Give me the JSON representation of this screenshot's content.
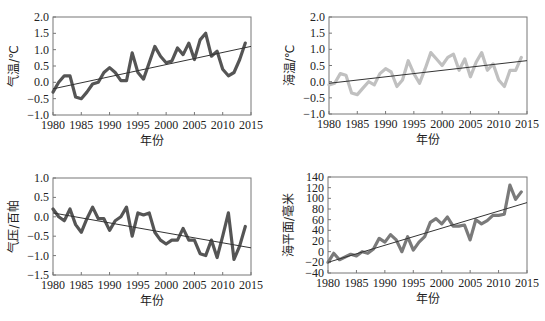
{
  "chart_data": [
    {
      "type": "line",
      "panel": "top-left",
      "title": "",
      "xlabel": "年份",
      "ylabel": "气温/℃",
      "xlim": [
        1980,
        2015
      ],
      "ylim": [
        -1.0,
        2.0
      ],
      "xticks": [
        1980,
        1985,
        1990,
        1995,
        2000,
        2005,
        2010,
        2015
      ],
      "yticks": [
        2.0,
        1.5,
        1.0,
        0.5,
        0.0,
        -0.5,
        -1.0
      ],
      "ytick_labels": [
        "2.0",
        "1.5",
        "1.0",
        "0.5",
        "0.0",
        "-0.5",
        "-1.0"
      ],
      "grid": false,
      "line_color": "#555555",
      "x": [
        1980,
        1981,
        1982,
        1983,
        1984,
        1985,
        1986,
        1987,
        1988,
        1989,
        1990,
        1991,
        1992,
        1993,
        1994,
        1995,
        1996,
        1997,
        1998,
        1999,
        2000,
        2001,
        2002,
        2003,
        2004,
        2005,
        2006,
        2007,
        2008,
        2009,
        2010,
        2011,
        2012,
        2013,
        2014
      ],
      "series": [
        {
          "name": "气温",
          "values": [
            -0.3,
            0.0,
            0.2,
            0.2,
            -0.45,
            -0.5,
            -0.3,
            -0.05,
            0.0,
            0.3,
            0.45,
            0.3,
            0.05,
            0.05,
            0.9,
            0.3,
            0.1,
            0.6,
            1.1,
            0.8,
            0.6,
            0.65,
            1.05,
            0.85,
            1.2,
            0.7,
            1.3,
            1.5,
            0.8,
            0.95,
            0.4,
            0.2,
            0.3,
            0.7,
            1.2
          ]
        }
      ],
      "trend": {
        "x": [
          1980,
          2015
        ],
        "y": [
          -0.2,
          1.1
        ]
      }
    },
    {
      "type": "line",
      "panel": "top-right",
      "title": "",
      "xlabel": "年份",
      "ylabel": "海温/℃",
      "xlim": [
        1980,
        2015
      ],
      "ylim": [
        -1.0,
        2.0
      ],
      "xticks": [
        1980,
        1985,
        1990,
        1995,
        2000,
        2005,
        2010,
        2015
      ],
      "yticks": [
        2.0,
        1.5,
        1.0,
        0.5,
        0.0,
        -0.5,
        -1.0
      ],
      "ytick_labels": [
        "2.0",
        "1.5",
        "1.0",
        "0.5",
        "0.0",
        "-0.5",
        "-1.0"
      ],
      "grid": false,
      "line_color": "#c0c0c0",
      "x": [
        1980,
        1981,
        1982,
        1983,
        1984,
        1985,
        1986,
        1987,
        1988,
        1989,
        1990,
        1991,
        1992,
        1993,
        1994,
        1995,
        1996,
        1997,
        1998,
        1999,
        2000,
        2001,
        2002,
        2003,
        2004,
        2005,
        2006,
        2007,
        2008,
        2009,
        2010,
        2011,
        2012,
        2013,
        2014
      ],
      "series": [
        {
          "name": "海温",
          "values": [
            -0.1,
            -0.05,
            0.25,
            0.2,
            -0.35,
            -0.4,
            -0.2,
            0.0,
            -0.1,
            0.25,
            0.4,
            0.3,
            -0.15,
            0.05,
            0.65,
            0.25,
            -0.05,
            0.4,
            0.9,
            0.7,
            0.5,
            0.75,
            0.85,
            0.35,
            0.7,
            0.15,
            0.6,
            0.9,
            0.35,
            0.55,
            0.05,
            -0.15,
            0.35,
            0.35,
            0.75
          ]
        }
      ],
      "trend": {
        "x": [
          1980,
          2015
        ],
        "y": [
          -0.05,
          0.65
        ]
      }
    },
    {
      "type": "line",
      "panel": "bottom-left",
      "title": "",
      "xlabel": "年份",
      "ylabel": "气压/百帕",
      "xlim": [
        1980,
        2015
      ],
      "ylim": [
        -1.5,
        1.0
      ],
      "xticks": [
        1980,
        1985,
        1990,
        1995,
        2000,
        2005,
        2010,
        2015
      ],
      "yticks": [
        1.0,
        0.5,
        0.0,
        -0.5,
        -1.0,
        -1.5
      ],
      "ytick_labels": [
        "1.0",
        "0.5",
        "0.0",
        "-0.5",
        "-1.0",
        "-1.5"
      ],
      "grid": false,
      "line_color": "#555555",
      "x": [
        1980,
        1981,
        1982,
        1983,
        1984,
        1985,
        1986,
        1987,
        1988,
        1989,
        1990,
        1991,
        1992,
        1993,
        1994,
        1995,
        1996,
        1997,
        1998,
        1999,
        2000,
        2001,
        2002,
        2003,
        2004,
        2005,
        2006,
        2007,
        2008,
        2009,
        2010,
        2011,
        2012,
        2013,
        2014
      ],
      "series": [
        {
          "name": "气压",
          "values": [
            0.2,
            0.0,
            -0.1,
            0.2,
            -0.2,
            -0.4,
            -0.05,
            0.25,
            -0.05,
            -0.05,
            -0.35,
            -0.1,
            0.0,
            0.25,
            -0.5,
            0.1,
            0.05,
            0.1,
            -0.4,
            -0.6,
            -0.7,
            -0.6,
            -0.6,
            -0.3,
            -0.6,
            -0.6,
            -0.95,
            -1.0,
            -0.6,
            -1.05,
            -0.5,
            0.1,
            -1.1,
            -0.75,
            -0.25
          ]
        }
      ],
      "trend": {
        "x": [
          1980,
          2015
        ],
        "y": [
          0.1,
          -0.8
        ]
      }
    },
    {
      "type": "line",
      "panel": "bottom-right",
      "title": "",
      "xlabel": "年份",
      "ylabel": "海平面/毫米",
      "xlim": [
        1980,
        2015
      ],
      "ylim": [
        -40,
        140
      ],
      "xticks": [
        1980,
        1985,
        1990,
        1995,
        2000,
        2005,
        2010,
        2015
      ],
      "yticks": [
        140,
        120,
        100,
        80,
        60,
        40,
        20,
        0,
        -20,
        -40
      ],
      "ytick_labels": [
        "140",
        "120",
        "100",
        "80",
        "60",
        "40",
        "20",
        "0",
        "-20",
        "-40"
      ],
      "grid": false,
      "line_color": "#7a7a7a",
      "x": [
        1980,
        1981,
        1982,
        1983,
        1984,
        1985,
        1986,
        1987,
        1988,
        1989,
        1990,
        1991,
        1992,
        1993,
        1994,
        1995,
        1996,
        1997,
        1998,
        1999,
        2000,
        2001,
        2002,
        2003,
        2004,
        2005,
        2006,
        2007,
        2008,
        2009,
        2010,
        2011,
        2012,
        2013,
        2014
      ],
      "series": [
        {
          "name": "海平面",
          "values": [
            -20,
            -3,
            -15,
            -10,
            -5,
            -8,
            0,
            -3,
            5,
            25,
            18,
            32,
            22,
            0,
            28,
            3,
            18,
            28,
            55,
            62,
            52,
            65,
            48,
            48,
            50,
            22,
            60,
            52,
            58,
            68,
            68,
            70,
            125,
            98,
            112
          ]
        }
      ],
      "trend": {
        "x": [
          1980,
          2015
        ],
        "y": [
          -20,
          92
        ]
      }
    }
  ],
  "layout": {
    "panels": [
      {
        "left": 53,
        "top": 17,
        "right": 251,
        "bottom": 115
      },
      {
        "left": 329,
        "top": 17,
        "right": 527,
        "bottom": 114
      },
      {
        "left": 53,
        "top": 178,
        "right": 251,
        "bottom": 275
      },
      {
        "left": 328,
        "top": 177,
        "right": 527,
        "bottom": 273
      }
    ],
    "trend_color": "#333333"
  }
}
